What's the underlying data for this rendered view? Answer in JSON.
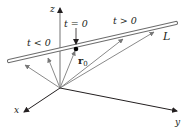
{
  "diagram": {
    "axes": {
      "x_label": "x",
      "y_label": "y",
      "z_label": "z"
    },
    "line": {
      "label": "L"
    },
    "point": {
      "label_main": "r",
      "label_sub": "0",
      "param_label": "t = 0"
    },
    "regions": {
      "negative": "t < 0",
      "positive": "t > 0"
    },
    "colors": {
      "axis": "#231f20",
      "vector": "#8a8a8a",
      "line_stroke": "#6d6d6d",
      "point": "#000000"
    }
  }
}
